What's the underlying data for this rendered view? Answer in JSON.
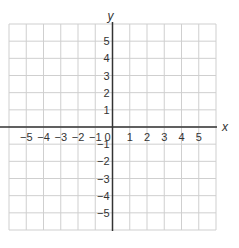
{
  "chart_data": {
    "type": "scatter",
    "title": "",
    "xlabel": "x",
    "ylabel": "y",
    "xlim": [
      -6,
      6
    ],
    "ylim": [
      -6,
      6
    ],
    "grid": true,
    "x_ticks": [
      -5,
      -4,
      -3,
      -2,
      -1,
      0,
      1,
      2,
      3,
      4,
      5
    ],
    "x_tick_labels": [
      "−5",
      "−4",
      "−3",
      "−2",
      "−1",
      "0",
      "1",
      "2",
      "3",
      "4",
      "5"
    ],
    "y_ticks": [
      5,
      4,
      3,
      2,
      1,
      -1,
      -2,
      -3,
      -4,
      -5
    ],
    "y_tick_labels": [
      "5",
      "4",
      "3",
      "2",
      "1",
      "−1",
      "−2",
      "−3",
      "−4",
      "−5"
    ],
    "series": [],
    "legend": null
  },
  "colors": {
    "grid": "#cfcfcf",
    "axis": "#333333",
    "text": "#333333",
    "background": "#ffffff"
  }
}
